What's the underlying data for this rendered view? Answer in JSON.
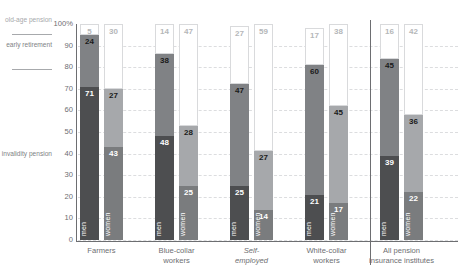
{
  "title": "",
  "legend": {
    "old_age": "old-age\npension",
    "early_retirement": "early\nretirement",
    "invalidity": "invalidity\npension"
  },
  "axis": {
    "y_ticks": [
      "100%",
      "90",
      "80",
      "70",
      "60",
      "50",
      "40",
      "30",
      "20",
      "10",
      "0"
    ],
    "y_max": 100,
    "y_min": 0
  },
  "gender_labels": {
    "men": "men",
    "women": "women"
  },
  "chart_data": {
    "type": "bar",
    "subtype": "stacked-bar-100pct",
    "title": "",
    "xlabel": "",
    "ylabel": "",
    "ylim": [
      0,
      100
    ],
    "grid": true,
    "legend_position": "left",
    "categories": [
      "Farmers",
      "Blue-collar workers",
      "Self-employed",
      "White-collar workers",
      "All pension insurance institutes"
    ],
    "subgroups": [
      "men",
      "women"
    ],
    "stack_order_bottom_to_top": [
      "invalidity pension",
      "early retirement",
      "old-age pension"
    ],
    "series": [
      {
        "name": "invalidity pension",
        "color": "#58595b",
        "values": {
          "men": [
            71,
            48,
            25,
            21,
            39
          ],
          "women": [
            43,
            25,
            14,
            17,
            22
          ]
        }
      },
      {
        "name": "early retirement",
        "color": "#a6a8ab",
        "values": {
          "men": [
            24,
            38,
            47,
            60,
            45
          ],
          "women": [
            27,
            28,
            27,
            45,
            36
          ]
        }
      },
      {
        "name": "old-age pension",
        "color": "#ffffff",
        "values": {
          "men": [
            5,
            14,
            27,
            17,
            16
          ],
          "women": [
            30,
            47,
            59,
            38,
            42
          ]
        }
      }
    ]
  },
  "groups": [
    {
      "label": "Farmers",
      "italic": false,
      "men": {
        "invalidity": 71,
        "early": 24,
        "oldage": 5
      },
      "women": {
        "invalidity": 43,
        "early": 27,
        "oldage": 30
      }
    },
    {
      "label": "Blue-collar\nworkers",
      "italic": false,
      "men": {
        "invalidity": 48,
        "early": 38,
        "oldage": 14
      },
      "women": {
        "invalidity": 25,
        "early": 28,
        "oldage": 47
      }
    },
    {
      "label": "Self-\nemployed",
      "italic": true,
      "men": {
        "invalidity": 25,
        "early": 47,
        "oldage": 27
      },
      "women": {
        "invalidity": 14,
        "early": 27,
        "oldage": 59
      }
    },
    {
      "label": "White-collar\nworkers",
      "italic": false,
      "men": {
        "invalidity": 21,
        "early": 60,
        "oldage": 17
      },
      "women": {
        "invalidity": 17,
        "early": 45,
        "oldage": 38
      }
    },
    {
      "label": "All pension\ninsurance institutes",
      "italic": false,
      "men": {
        "invalidity": 39,
        "early": 45,
        "oldage": 16
      },
      "women": {
        "invalidity": 22,
        "early": 36,
        "oldage": 42
      }
    }
  ],
  "colors": {
    "invalidity": "#58595b",
    "early": "#a6a8ab",
    "oldage": "#ffffff",
    "axis": "#6d6e71",
    "grid": "#dcdddf",
    "text": "#6d6e71"
  }
}
